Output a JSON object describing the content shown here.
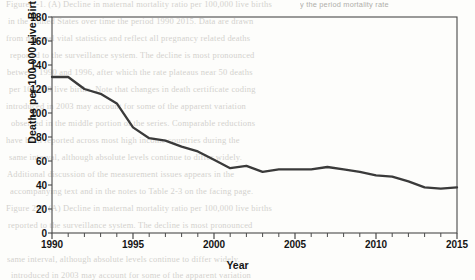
{
  "page": {
    "bleed_text": [
      "Figure 2-1. (A) Decline in maternal mortality ratio per 100,000 live births",
      "in the United States over time the period 1990 2015. Data are drawn",
      "from national vital statistics and reflect all pregnancy related deaths",
      "reported to the surveillance system. The decline is most pronounced",
      "between 1990 and 1996, after which the rate plateaus near 50 deaths",
      "per 100,000 live births. Note that changes in death certificate coding",
      "introduced in 2003 may account for some of the apparent variation",
      "observed in the middle portion of the series. Comparable reductions",
      "have been reported across most high income countries during the",
      "same interval, although absolute levels continue to differ widely.",
      "Additional discussion of the measurement issues appears in the",
      "accompanying text and in the notes to Table 2-3 on the facing page."
    ],
    "bleed_header": "y the period mortality rate"
  },
  "chart_data": {
    "type": "line",
    "title": "",
    "xlabel": "Year",
    "ylabel": "Deaths per 100,000 Live Births",
    "xlim": [
      1990,
      2015
    ],
    "ylim": [
      0,
      180
    ],
    "ytick_step": 20,
    "xtick_major_step": 5,
    "xtick_minor_step": 1,
    "grid": false,
    "legend": "none",
    "line_color": "#3a3a3a",
    "axis_color": "#444444",
    "yticks": [
      0,
      20,
      40,
      60,
      80,
      100,
      120,
      140,
      160,
      180
    ],
    "xticks": [
      1990,
      1995,
      2000,
      2005,
      2010,
      2015
    ],
    "x": [
      1990,
      1991,
      1992,
      1993,
      1994,
      1995,
      1996,
      1997,
      1998,
      1999,
      2000,
      2001,
      2002,
      2003,
      2004,
      2005,
      2006,
      2007,
      2008,
      2009,
      2010,
      2011,
      2012,
      2013,
      2014,
      2015
    ],
    "values": [
      130,
      130,
      120,
      116,
      108,
      88,
      79,
      77,
      72,
      68,
      61,
      54,
      56,
      51,
      53,
      53,
      53,
      55,
      53,
      51,
      48,
      47,
      43,
      38,
      37,
      38
    ],
    "series": [
      {
        "name": "Maternal mortality ratio",
        "values": [
          130,
          130,
          120,
          116,
          108,
          88,
          79,
          77,
          72,
          68,
          61,
          54,
          56,
          51,
          53,
          53,
          53,
          55,
          53,
          51,
          48,
          47,
          43,
          38,
          37,
          38
        ]
      }
    ]
  }
}
